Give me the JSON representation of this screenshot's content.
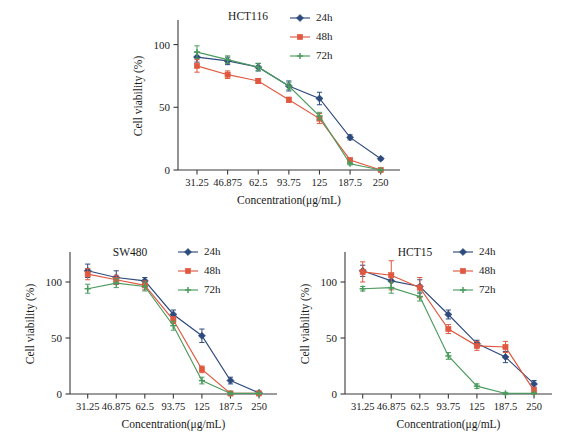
{
  "figure": {
    "background": "#ffffff",
    "series_colors": {
      "24h": "#2E4A7D",
      "48h": "#E0583F",
      "72h": "#4C9B5E"
    },
    "legend_labels": [
      "24h",
      "48h",
      "72h"
    ],
    "axis_label_x": "Concentration(μg/mL)",
    "axis_label_y": "Cell viability (%)",
    "categories": [
      "31.25",
      "46.875",
      "62.5",
      "93.75",
      "125",
      "187.5",
      "250"
    ]
  },
  "chart_data": [
    {
      "id": "hct116",
      "type": "line",
      "title": "HCT116",
      "xlabel": "Concentration(μg/mL)",
      "ylabel": "Cell viability (%)",
      "categories": [
        "31.25",
        "46.875",
        "62.5",
        "93.75",
        "125",
        "187.5",
        "250"
      ],
      "yticks": [
        0,
        50,
        100
      ],
      "ylim": [
        0,
        118
      ],
      "grid": false,
      "legend_position": "top-right",
      "series": [
        {
          "name": "24h",
          "color": "#2E4A7D",
          "marker": "diamond",
          "values": [
            90,
            87,
            82,
            67,
            57,
            26,
            9
          ],
          "errors": [
            4,
            3,
            3,
            4,
            5,
            2,
            1
          ]
        },
        {
          "name": "48h",
          "color": "#E0583F",
          "marker": "square",
          "values": [
            83,
            76,
            71,
            56,
            41,
            8,
            0
          ],
          "errors": [
            5,
            3,
            2,
            2,
            4,
            1,
            0.5
          ]
        },
        {
          "name": "72h",
          "color": "#4C9B5E",
          "marker": "cross",
          "values": [
            94,
            88,
            82,
            67,
            43,
            5,
            0
          ],
          "errors": [
            5,
            3,
            3,
            3,
            3,
            1,
            0.5
          ]
        }
      ]
    },
    {
      "id": "sw480",
      "type": "line",
      "title": "SW480",
      "xlabel": "Concentration(μg/mL)",
      "ylabel": "Cell viability (%)",
      "categories": [
        "31.25",
        "46.875",
        "62.5",
        "93.75",
        "125",
        "187.5",
        "250"
      ],
      "yticks": [
        0,
        50,
        100
      ],
      "ylim": [
        0,
        125
      ],
      "grid": false,
      "legend_position": "top-right",
      "series": [
        {
          "name": "24h",
          "color": "#2E4A7D",
          "marker": "diamond",
          "values": [
            110,
            104,
            101,
            71,
            52,
            12,
            1
          ],
          "errors": [
            6,
            6,
            3,
            4,
            6,
            3,
            1
          ]
        },
        {
          "name": "48h",
          "color": "#E0583F",
          "marker": "square",
          "values": [
            107,
            102,
            97,
            66,
            22,
            0.5,
            0.5
          ],
          "errors": [
            5,
            4,
            4,
            3,
            3,
            1,
            0.5
          ]
        },
        {
          "name": "72h",
          "color": "#4C9B5E",
          "marker": "cross",
          "values": [
            94,
            99,
            96,
            61,
            12,
            0.5,
            0.5
          ],
          "errors": [
            4,
            4,
            4,
            4,
            3,
            1,
            0.5
          ]
        }
      ]
    },
    {
      "id": "hct15",
      "type": "line",
      "title": "HCT15",
      "xlabel": "Concentration(μg/mL)",
      "ylabel": "Cell viability (%)",
      "categories": [
        "31.25",
        "46.875",
        "62.5",
        "93.75",
        "125",
        "187.5",
        "250"
      ],
      "yticks": [
        0,
        50,
        100
      ],
      "ylim": [
        0,
        125
      ],
      "grid": false,
      "legend_position": "top-right",
      "series": [
        {
          "name": "24h",
          "color": "#2E4A7D",
          "marker": "diamond",
          "values": [
            110,
            101,
            96,
            71,
            45,
            33,
            9
          ],
          "errors": [
            5,
            6,
            6,
            4,
            3,
            5,
            3
          ]
        },
        {
          "name": "48h",
          "color": "#E0583F",
          "marker": "square",
          "values": [
            109,
            106,
            95,
            58,
            43,
            42,
            3
          ],
          "errors": [
            9,
            13,
            9,
            4,
            4,
            5,
            3
          ]
        },
        {
          "name": "72h",
          "color": "#4C9B5E",
          "marker": "cross",
          "values": [
            94,
            95,
            87,
            34,
            7,
            0.5,
            0.5
          ],
          "errors": [
            2,
            5,
            4,
            3,
            2,
            1,
            0.5
          ]
        }
      ]
    }
  ]
}
